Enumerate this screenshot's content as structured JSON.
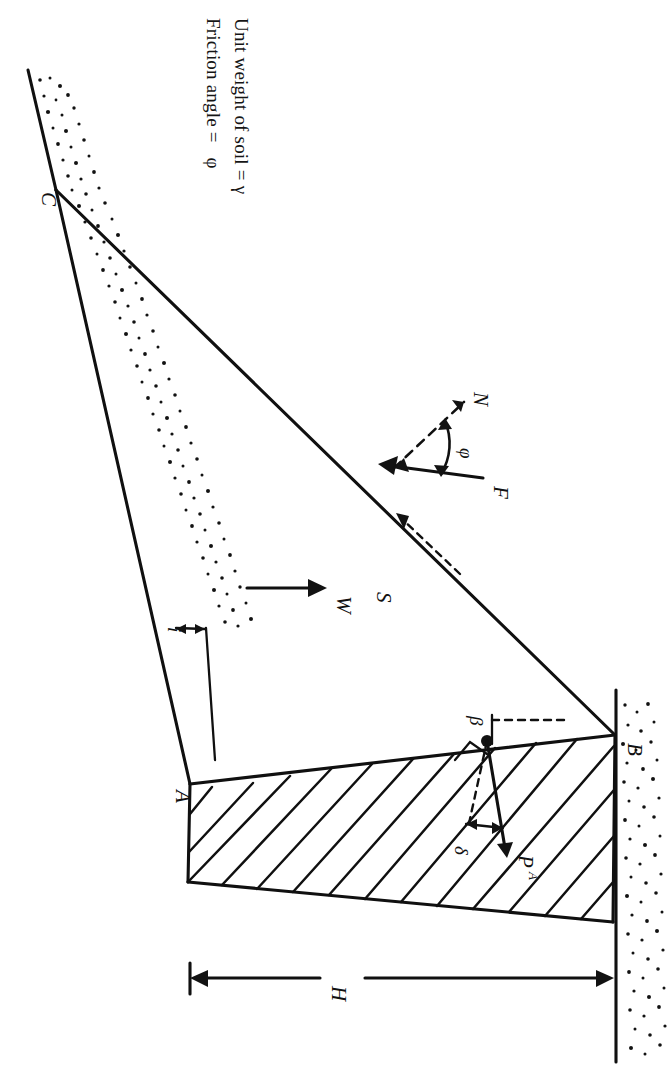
{
  "figure": {
    "orientation": "rotated-90-clockwise",
    "background_color": "#ffffff",
    "line_color": "#101010"
  },
  "notes": {
    "line1": "Unit weight of soil = γ",
    "line2": "Friction angle =   φ",
    "line1_text": "Unit weight of soil =",
    "line1_symbol": "γ",
    "line2_text": "Friction angle =",
    "line2_symbol": "φ"
  },
  "points": [
    {
      "id": "A",
      "label": "A"
    },
    {
      "id": "B",
      "label": "B"
    },
    {
      "id": "C",
      "label": "C"
    }
  ],
  "forces": [
    {
      "id": "W",
      "label": "W",
      "style": "solid",
      "description": "weight of failure wedge"
    },
    {
      "id": "N",
      "label": "N",
      "style": "dashed",
      "description": "normal reaction on failure plane"
    },
    {
      "id": "F",
      "label": "F",
      "style": "solid",
      "description": "resultant reaction inclined at phi"
    },
    {
      "id": "S",
      "label": "S",
      "style": "dashed",
      "description": "shear resistance along failure plane"
    },
    {
      "id": "PA",
      "label": "P",
      "subscript": "A",
      "style": "solid",
      "description": "active earth thrust on wall"
    }
  ],
  "angles": [
    {
      "id": "i",
      "label": "i",
      "description": "backfill slope angle"
    },
    {
      "id": "phi",
      "label": "φ",
      "description": "soil friction angle between N and F"
    },
    {
      "id": "beta",
      "label": "β",
      "description": "inclination of wall back face from horizontal"
    },
    {
      "id": "delta",
      "label": "δ",
      "description": "wall friction angle between normal and PA"
    }
  ],
  "dimensions": [
    {
      "id": "H",
      "label": "H",
      "description": "height of wall back face from A to B"
    }
  ],
  "legend_symbols": {
    "gamma": "γ",
    "phi": "φ",
    "beta": "β",
    "delta": "δ",
    "i": "i"
  }
}
